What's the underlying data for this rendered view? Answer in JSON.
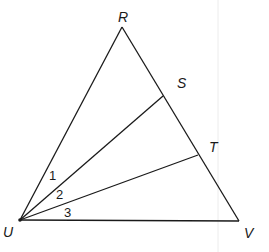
{
  "diagram": {
    "type": "triangle-with-cevians",
    "vertices": {
      "R": {
        "label": "R",
        "x": 122,
        "y": 27
      },
      "U": {
        "label": "U",
        "x": 20,
        "y": 220
      },
      "V": {
        "label": "V",
        "x": 239,
        "y": 221
      }
    },
    "points_on_side": {
      "S": {
        "label": "S",
        "x": 163,
        "y": 96
      },
      "T": {
        "label": "T",
        "x": 198,
        "y": 155
      }
    },
    "segments": [
      [
        "R",
        "U"
      ],
      [
        "R",
        "V"
      ],
      [
        "U",
        "V"
      ],
      [
        "U",
        "S"
      ],
      [
        "U",
        "T"
      ]
    ],
    "angles": [
      {
        "label": "1",
        "between": [
          "UR",
          "US"
        ]
      },
      {
        "label": "2",
        "between": [
          "US",
          "UT"
        ]
      },
      {
        "label": "3",
        "between": [
          "UT",
          "UV"
        ]
      }
    ],
    "colors": {
      "stroke": "#1a1a1a",
      "background": "#ffffff",
      "guide": "#e6e6e6"
    }
  }
}
